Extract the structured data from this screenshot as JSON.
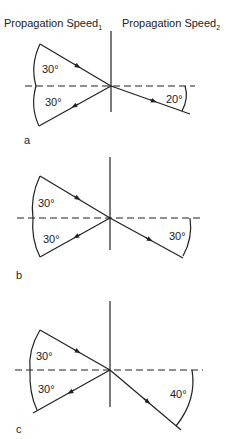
{
  "header": {
    "left": {
      "text": "Propagation Speed",
      "sub": "1"
    },
    "right": {
      "text": "Propagation Speed",
      "sub": "2"
    }
  },
  "panels": [
    {
      "label": "a",
      "incidence_angle": "30°",
      "reflection_angle": "30°",
      "refraction_angle": "20°"
    },
    {
      "label": "b",
      "incidence_angle": "30°",
      "reflection_angle": "30°",
      "refraction_angle": "30°"
    },
    {
      "label": "c",
      "incidence_angle": "30°",
      "reflection_angle": "30°",
      "refraction_angle": "40°"
    }
  ]
}
